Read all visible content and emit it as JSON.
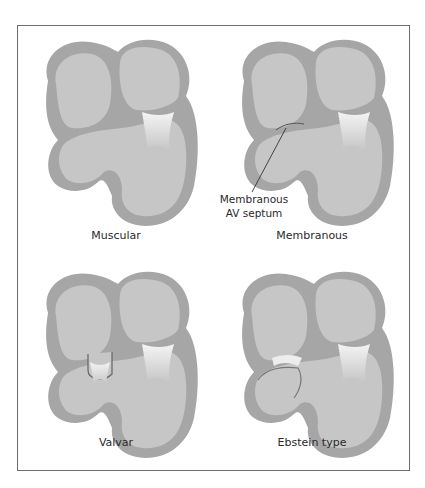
{
  "figure": {
    "panels": [
      {
        "id": "muscular",
        "caption": "Muscular"
      },
      {
        "id": "membranous",
        "caption": "Membranous",
        "annotation": {
          "line1": "Membranous",
          "line2": "AV septum"
        }
      },
      {
        "id": "valvar",
        "caption": "Valvar"
      },
      {
        "id": "ebstein",
        "caption": "Ebstein type"
      }
    ],
    "colors": {
      "wall": "#a6a6a6",
      "chamber": "#c6c6c6",
      "valve": "#ededed",
      "frame": "#6e6e6e",
      "background": "#ffffff"
    }
  }
}
